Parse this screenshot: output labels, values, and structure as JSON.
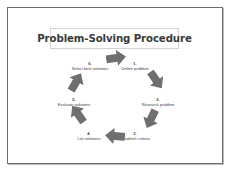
{
  "slide": {
    "title": "Problem-Solving Procedure",
    "colors": {
      "arrow": "#6f6f6f",
      "border": "#6e6e6e",
      "text": "#3a3a3a"
    },
    "steps": [
      {
        "number": "1.",
        "label": "Define problem"
      },
      {
        "number": "2.",
        "label": "Research problem"
      },
      {
        "number": "3.",
        "label": "Establish criteria"
      },
      {
        "number": "4.",
        "label": "List solutions"
      },
      {
        "number": "5.",
        "label": "Evaluate solutions"
      },
      {
        "number": "6.",
        "label": "Select best solutions"
      }
    ],
    "arrows": [
      {
        "icon": "arrow-right-icon",
        "direction": "right"
      },
      {
        "icon": "arrow-down-right-icon",
        "direction": "down-right"
      },
      {
        "icon": "arrow-down-left-icon",
        "direction": "down-left"
      },
      {
        "icon": "arrow-left-icon",
        "direction": "left"
      },
      {
        "icon": "arrow-up-left-icon",
        "direction": "up-left"
      },
      {
        "icon": "arrow-up-right-icon",
        "direction": "up-right"
      }
    ]
  }
}
